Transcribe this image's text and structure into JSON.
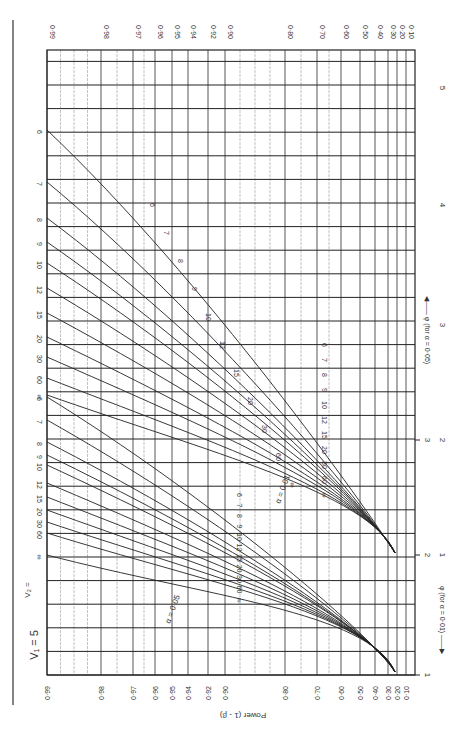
{
  "chart_data": {
    "type": "line",
    "orientation": "rotated 90 degrees clockwise (power axis runs along top/bottom edges, phi axis along right edge)",
    "v1_label": "V₁ = 5",
    "ylabel": "Power (1 - β)",
    "xlabel_alpha_001": "φ (for α = 0·01)",
    "xlabel_alpha_005": "φ (for α = 0·05)",
    "power_ticks": [
      "0·99",
      "0·98",
      "0·97",
      "0·96",
      "0·95",
      "0·94",
      "0·92",
      "0·90",
      "0·80",
      "0·70",
      "0·60",
      "0·50",
      "0·40",
      "0·30",
      "0·20",
      "0·10"
    ],
    "power_tick_values": [
      0.99,
      0.98,
      0.97,
      0.96,
      0.95,
      0.94,
      0.92,
      0.9,
      0.8,
      0.7,
      0.6,
      0.5,
      0.4,
      0.3,
      0.2,
      0.1
    ],
    "phi_ticks_alpha_001": [
      "1",
      "2",
      "3"
    ],
    "phi_ticks_alpha_005": [
      "1",
      "2",
      "3",
      "4",
      "5"
    ],
    "grid": true,
    "series_groups": [
      {
        "alpha": "0·01",
        "label": "α = 0·01",
        "v2_labels": [
          "6",
          "7",
          "8",
          "9",
          "10",
          "12",
          "15",
          "20",
          "30",
          "60",
          "∞"
        ],
        "phi_at_power_099_approx": [
          4.55,
          4.1,
          3.8,
          3.6,
          3.45,
          3.25,
          3.05,
          2.85,
          2.7,
          2.5,
          2.35
        ]
      },
      {
        "alpha": "0·05",
        "label": "α = 0·05",
        "v2_labels": [
          "6",
          "7",
          "8",
          "9",
          "10",
          "12",
          "15",
          "20",
          "30",
          "60",
          "∞"
        ],
        "phi_at_power_099_approx": [
          3.65,
          3.45,
          3.3,
          3.2,
          3.1,
          2.95,
          2.85,
          2.75,
          2.65,
          2.55,
          2.4
        ]
      }
    ],
    "left_edge_label_prefix": "V₂ = "
  },
  "layout": {
    "frame": {
      "x0": 47,
      "x1": 415,
      "y0": 50,
      "y1": 675
    },
    "power_tick_x": [
      47,
      101,
      133,
      155,
      172,
      188,
      208,
      225,
      285,
      317,
      341,
      360,
      375,
      388,
      397,
      406
    ],
    "phi001_tick_y": [
      675,
      555,
      440
    ],
    "phi005_tick_y": [
      555,
      440,
      325,
      205,
      88
    ]
  },
  "curves": {
    "a001": {
      "labels": [
        "6",
        "7",
        "8",
        "9",
        "10",
        "12",
        "15",
        "20",
        "30",
        "60",
        "∞"
      ],
      "start_y": [
        130,
        182,
        218,
        242,
        263,
        288,
        313,
        337,
        357,
        378,
        395
      ],
      "mid_label_y": [
        342,
        372,
        398,
        420,
        437,
        460,
        480,
        500,
        520,
        542,
        560
      ],
      "end": [
        395,
        553
      ]
    },
    "a005": {
      "labels": [
        "6",
        "7",
        "8",
        "9",
        "10",
        "12",
        "15",
        "20",
        "30",
        "60",
        "∞"
      ],
      "start_y": [
        397,
        420,
        442,
        455,
        465,
        483,
        497,
        510,
        522,
        533,
        555
      ],
      "mid_label_y": [
        557,
        578,
        594,
        604,
        612,
        630,
        650,
        668,
        690,
        715,
        735
      ],
      "end": [
        395,
        672
      ]
    }
  }
}
